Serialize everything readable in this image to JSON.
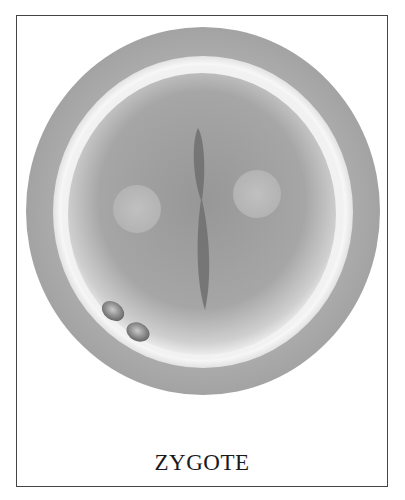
{
  "figure": {
    "caption": "ZYGOTE",
    "colors": {
      "frame_border": "#444444",
      "zona_pellucida": "#a9a9a9",
      "perivitelline_ring_light": "#f4f4f4",
      "cytoplasm_center": "#9a9a9a",
      "cytoplasm_edge": "#e6e6e6",
      "pronucleus": "#b8b8b8",
      "spindle": "#6e6e6e",
      "polar_body": "#8a8a8a"
    },
    "structures": [
      {
        "name": "zona-pellucida",
        "shape": "ellipse",
        "cx": 203,
        "cy": 211,
        "rx": 177,
        "ry": 184
      },
      {
        "name": "perivitelline-space",
        "shape": "ellipse",
        "cx": 203,
        "cy": 212,
        "rx": 150,
        "ry": 156
      },
      {
        "name": "cytoplasm",
        "shape": "ellipse",
        "cx": 202,
        "cy": 214,
        "rx": 134,
        "ry": 141
      },
      {
        "name": "pronucleus-left",
        "shape": "circle",
        "cx": 137,
        "cy": 209,
        "r": 24
      },
      {
        "name": "pronucleus-right",
        "shape": "circle",
        "cx": 257,
        "cy": 194,
        "r": 24
      },
      {
        "name": "spindle",
        "shape": "path",
        "x_range": [
          193,
          211
        ],
        "y_range": [
          128,
          310
        ]
      },
      {
        "name": "polar-body-1",
        "shape": "ellipse",
        "cx": 113,
        "cy": 311,
        "rx": 12,
        "ry": 9,
        "rotate": 35
      },
      {
        "name": "polar-body-2",
        "shape": "ellipse",
        "cx": 138,
        "cy": 332,
        "rx": 12,
        "ry": 9,
        "rotate": 25
      }
    ]
  }
}
